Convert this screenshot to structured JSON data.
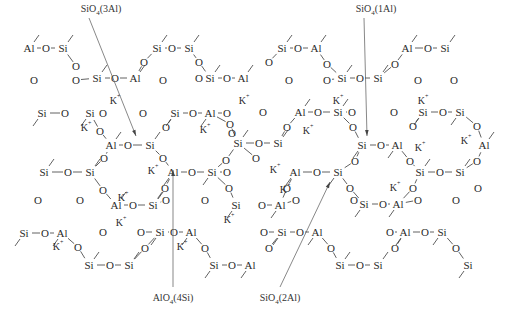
{
  "diagram": {
    "type": "chemical-structure",
    "annotations": [
      {
        "id": "sio4_3al",
        "text": "SiO4(3Al)",
        "base": "SiO",
        "sub": "4",
        "suffix": "(3Al)",
        "x": 101,
        "y": 12,
        "tx": 136,
        "ty": 136,
        "pos": "top"
      },
      {
        "id": "sio4_1al",
        "text": "SiO4(1Al)",
        "base": "SiO",
        "sub": "4",
        "suffix": "(1Al)",
        "x": 376,
        "y": 12,
        "tx": 367,
        "ty": 136,
        "pos": "top"
      },
      {
        "id": "alo4_4si",
        "text": "AlO4(4Si)",
        "base": "AlO",
        "sub": "4",
        "suffix": "(4Si)",
        "x": 173,
        "y": 301,
        "tx": 173,
        "ty": 170,
        "pos": "bottom"
      },
      {
        "id": "sio4_2al",
        "text": "SiO4(2Al)",
        "base": "SiO",
        "sub": "4",
        "suffix": "(2Al)",
        "x": 280,
        "y": 301,
        "tx": 330,
        "ty": 182,
        "pos": "bottom"
      }
    ],
    "counter_ion": "K+",
    "atoms": [
      {
        "e": "Al",
        "x": 29,
        "y": 48
      },
      {
        "e": "O",
        "x": 46,
        "y": 48
      },
      {
        "e": "Si",
        "x": 63,
        "y": 48
      },
      {
        "e": "O",
        "x": 34,
        "y": 80
      },
      {
        "e": "O",
        "x": 76,
        "y": 66
      },
      {
        "e": "O",
        "x": 76,
        "y": 80
      },
      {
        "e": "Si",
        "x": 97,
        "y": 78
      },
      {
        "e": "O",
        "x": 115,
        "y": 78
      },
      {
        "e": "Al",
        "x": 135,
        "y": 78
      },
      {
        "e": "O",
        "x": 144,
        "y": 62
      },
      {
        "e": "Si",
        "x": 157,
        "y": 48
      },
      {
        "e": "O",
        "x": 172,
        "y": 48
      },
      {
        "e": "Si",
        "x": 189,
        "y": 48
      },
      {
        "e": "O",
        "x": 163,
        "y": 80
      },
      {
        "e": "O",
        "x": 199,
        "y": 62
      },
      {
        "e": "O",
        "x": 199,
        "y": 78
      },
      {
        "e": "Si",
        "x": 210,
        "y": 78
      },
      {
        "e": "O",
        "x": 227,
        "y": 78
      },
      {
        "e": "Al",
        "x": 243,
        "y": 78
      },
      {
        "e": "O",
        "x": 269,
        "y": 62
      },
      {
        "e": "Si",
        "x": 282,
        "y": 48
      },
      {
        "e": "O",
        "x": 298,
        "y": 48
      },
      {
        "e": "Al",
        "x": 316,
        "y": 48
      },
      {
        "e": "O",
        "x": 289,
        "y": 80
      },
      {
        "e": "O",
        "x": 327,
        "y": 64
      },
      {
        "e": "O",
        "x": 327,
        "y": 80
      },
      {
        "e": "Si",
        "x": 342,
        "y": 78
      },
      {
        "e": "O",
        "x": 360,
        "y": 78
      },
      {
        "e": "Si",
        "x": 378,
        "y": 78
      },
      {
        "e": "O",
        "x": 395,
        "y": 64
      },
      {
        "e": "Al",
        "x": 407,
        "y": 48
      },
      {
        "e": "O",
        "x": 428,
        "y": 48
      },
      {
        "e": "Si",
        "x": 445,
        "y": 48
      },
      {
        "e": "O",
        "x": 418,
        "y": 80
      },
      {
        "e": "O",
        "x": 454,
        "y": 80
      },
      {
        "e": "Si",
        "x": 42,
        "y": 113
      },
      {
        "e": "O",
        "x": 65,
        "y": 113
      },
      {
        "e": "Si",
        "x": 90,
        "y": 113
      },
      {
        "e": "O",
        "x": 103,
        "y": 113
      },
      {
        "e": "O",
        "x": 100,
        "y": 131
      },
      {
        "e": "O",
        "x": 143,
        "y": 113
      },
      {
        "e": "Si",
        "x": 175,
        "y": 113
      },
      {
        "e": "O",
        "x": 193,
        "y": 113
      },
      {
        "e": "Al",
        "x": 210,
        "y": 113
      },
      {
        "e": "O",
        "x": 227,
        "y": 113
      },
      {
        "e": "O",
        "x": 166,
        "y": 127
      },
      {
        "e": "O",
        "x": 230,
        "y": 124
      },
      {
        "e": "O",
        "x": 263,
        "y": 112
      },
      {
        "e": "Al",
        "x": 300,
        "y": 112
      },
      {
        "e": "O",
        "x": 318,
        "y": 112
      },
      {
        "e": "Si",
        "x": 338,
        "y": 112
      },
      {
        "e": "O",
        "x": 287,
        "y": 127
      },
      {
        "e": "O",
        "x": 352,
        "y": 112
      },
      {
        "e": "O",
        "x": 353,
        "y": 127
      },
      {
        "e": "O",
        "x": 394,
        "y": 112
      },
      {
        "e": "Si",
        "x": 423,
        "y": 112
      },
      {
        "e": "O",
        "x": 443,
        "y": 112
      },
      {
        "e": "Si",
        "x": 460,
        "y": 112
      },
      {
        "e": "O",
        "x": 413,
        "y": 126
      },
      {
        "e": "O",
        "x": 477,
        "y": 126
      },
      {
        "e": "Al",
        "x": 111,
        "y": 145
      },
      {
        "e": "O",
        "x": 128,
        "y": 145
      },
      {
        "e": "Si",
        "x": 150,
        "y": 145
      },
      {
        "e": "O",
        "x": 104,
        "y": 158
      },
      {
        "e": "O",
        "x": 163,
        "y": 158
      },
      {
        "e": "O",
        "x": 232,
        "y": 133
      },
      {
        "e": "Si",
        "x": 238,
        "y": 143
      },
      {
        "e": "O",
        "x": 259,
        "y": 143
      },
      {
        "e": "Si",
        "x": 278,
        "y": 143
      },
      {
        "e": "O",
        "x": 256,
        "y": 158
      },
      {
        "e": "O",
        "x": 226,
        "y": 160
      },
      {
        "e": "Si",
        "x": 362,
        "y": 145
      },
      {
        "e": "O",
        "x": 381,
        "y": 145
      },
      {
        "e": "Al",
        "x": 397,
        "y": 145
      },
      {
        "e": "O",
        "x": 355,
        "y": 161
      },
      {
        "e": "O",
        "x": 410,
        "y": 161
      },
      {
        "e": "Al",
        "x": 484,
        "y": 145
      },
      {
        "e": "O",
        "x": 477,
        "y": 161
      },
      {
        "e": "Si",
        "x": 44,
        "y": 172
      },
      {
        "e": "O",
        "x": 68,
        "y": 172
      },
      {
        "e": "Si",
        "x": 90,
        "y": 172
      },
      {
        "e": "Al",
        "x": 173,
        "y": 172
      },
      {
        "e": "O",
        "x": 192,
        "y": 172
      },
      {
        "e": "Si",
        "x": 212,
        "y": 172
      },
      {
        "e": "O",
        "x": 227,
        "y": 172
      },
      {
        "e": "O",
        "x": 165,
        "y": 188
      },
      {
        "e": "O",
        "x": 229,
        "y": 188
      },
      {
        "e": "Al",
        "x": 295,
        "y": 172
      },
      {
        "e": "O",
        "x": 317,
        "y": 172
      },
      {
        "e": "Si",
        "x": 338,
        "y": 172
      },
      {
        "e": "O",
        "x": 287,
        "y": 188
      },
      {
        "e": "O",
        "x": 350,
        "y": 188
      },
      {
        "e": "Si",
        "x": 420,
        "y": 172
      },
      {
        "e": "O",
        "x": 440,
        "y": 172
      },
      {
        "e": "Si",
        "x": 460,
        "y": 172
      },
      {
        "e": "O",
        "x": 413,
        "y": 188
      },
      {
        "e": "O",
        "x": 478,
        "y": 188
      },
      {
        "e": "O",
        "x": 38,
        "y": 200
      },
      {
        "e": "O",
        "x": 80,
        "y": 200
      },
      {
        "e": "O",
        "x": 103,
        "y": 190
      },
      {
        "e": "Al",
        "x": 116,
        "y": 205
      },
      {
        "e": "O",
        "x": 133,
        "y": 205
      },
      {
        "e": "Si",
        "x": 153,
        "y": 205
      },
      {
        "e": "O",
        "x": 166,
        "y": 200
      },
      {
        "e": "O",
        "x": 205,
        "y": 200
      },
      {
        "e": "Si",
        "x": 236,
        "y": 205
      },
      {
        "e": "O",
        "x": 262,
        "y": 205
      },
      {
        "e": "Al",
        "x": 280,
        "y": 205
      },
      {
        "e": "O",
        "x": 296,
        "y": 200
      },
      {
        "e": "Si",
        "x": 364,
        "y": 204
      },
      {
        "e": "O",
        "x": 383,
        "y": 204
      },
      {
        "e": "Al",
        "x": 398,
        "y": 204
      },
      {
        "e": "O",
        "x": 354,
        "y": 200
      },
      {
        "e": "O",
        "x": 418,
        "y": 200
      },
      {
        "e": "O",
        "x": 456,
        "y": 200
      },
      {
        "e": "Si",
        "x": 24,
        "y": 233
      },
      {
        "e": "O",
        "x": 45,
        "y": 233
      },
      {
        "e": "Al",
        "x": 62,
        "y": 233
      },
      {
        "e": "O",
        "x": 103,
        "y": 232
      },
      {
        "e": "Si",
        "x": 160,
        "y": 232
      },
      {
        "e": "O",
        "x": 174,
        "y": 232
      },
      {
        "e": "Al",
        "x": 191,
        "y": 232
      },
      {
        "e": "O",
        "x": 141,
        "y": 232
      },
      {
        "e": "O",
        "x": 145,
        "y": 248
      },
      {
        "e": "O",
        "x": 205,
        "y": 248
      },
      {
        "e": "Si",
        "x": 282,
        "y": 232
      },
      {
        "e": "O",
        "x": 300,
        "y": 232
      },
      {
        "e": "Al",
        "x": 317,
        "y": 232
      },
      {
        "e": "O",
        "x": 264,
        "y": 232
      },
      {
        "e": "O",
        "x": 269,
        "y": 248
      },
      {
        "e": "O",
        "x": 331,
        "y": 248
      },
      {
        "e": "Al",
        "x": 405,
        "y": 232
      },
      {
        "e": "O",
        "x": 425,
        "y": 232
      },
      {
        "e": "Si",
        "x": 442,
        "y": 232
      },
      {
        "e": "O",
        "x": 390,
        "y": 232
      },
      {
        "e": "O",
        "x": 395,
        "y": 248
      },
      {
        "e": "O",
        "x": 456,
        "y": 248
      },
      {
        "e": "O",
        "x": 78,
        "y": 247
      },
      {
        "e": "Si",
        "x": 89,
        "y": 265
      },
      {
        "e": "O",
        "x": 110,
        "y": 265
      },
      {
        "e": "Si",
        "x": 129,
        "y": 265
      },
      {
        "e": "Si",
        "x": 214,
        "y": 265
      },
      {
        "e": "O",
        "x": 232,
        "y": 265
      },
      {
        "e": "Al",
        "x": 250,
        "y": 265
      },
      {
        "e": "Si",
        "x": 340,
        "y": 265
      },
      {
        "e": "O",
        "x": 360,
        "y": 265
      },
      {
        "e": "Si",
        "x": 378,
        "y": 265
      },
      {
        "e": "Si",
        "x": 468,
        "y": 265
      }
    ],
    "k_ions": [
      {
        "x": 115,
        "y": 100
      },
      {
        "x": 244,
        "y": 100
      },
      {
        "x": 338,
        "y": 100
      },
      {
        "x": 423,
        "y": 100
      },
      {
        "x": 86,
        "y": 127
      },
      {
        "x": 205,
        "y": 129
      },
      {
        "x": 308,
        "y": 130
      },
      {
        "x": 153,
        "y": 170
      },
      {
        "x": 275,
        "y": 169
      },
      {
        "x": 420,
        "y": 147
      },
      {
        "x": 466,
        "y": 140
      },
      {
        "x": 121,
        "y": 222
      },
      {
        "x": 229,
        "y": 219
      },
      {
        "x": 285,
        "y": 189
      },
      {
        "x": 395,
        "y": 187
      },
      {
        "x": 58,
        "y": 246
      },
      {
        "x": 182,
        "y": 246
      },
      {
        "x": 123,
        "y": 197
      }
    ]
  }
}
